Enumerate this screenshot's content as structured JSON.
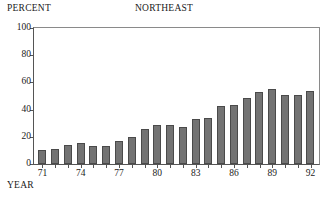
{
  "chart_data": {
    "type": "bar",
    "title": "NORTHEAST",
    "ylabel": "PERCENT",
    "xlabel": "YEAR",
    "categories": [
      "71",
      "72",
      "73",
      "74",
      "75",
      "76",
      "77",
      "78",
      "79",
      "80",
      "81",
      "82",
      "83",
      "84",
      "85",
      "86",
      "87",
      "88",
      "89",
      "90",
      "91",
      "92"
    ],
    "values": [
      10,
      11,
      14,
      15.5,
      13,
      13,
      17,
      20,
      26,
      29,
      28.5,
      27,
      33,
      34,
      42.5,
      43.5,
      48.5,
      53,
      55,
      50.5,
      51,
      54
    ],
    "ylim": [
      0,
      100
    ],
    "yticks": [
      0,
      20,
      40,
      60,
      80,
      100
    ],
    "ytick_labels": [
      "0",
      "20",
      "40",
      "60",
      "80",
      "100"
    ],
    "xtick_labels": [
      "71",
      "74",
      "77",
      "80",
      "83",
      "86",
      "89",
      "92"
    ],
    "xtick_categories": [
      "71",
      "74",
      "77",
      "80",
      "83",
      "86",
      "89",
      "92"
    ],
    "grid": false,
    "legend": false,
    "bar_color": "#737373",
    "bar_edge_color": "#4a4a4a",
    "axis_color": "#555555",
    "background": "#ffffff"
  }
}
